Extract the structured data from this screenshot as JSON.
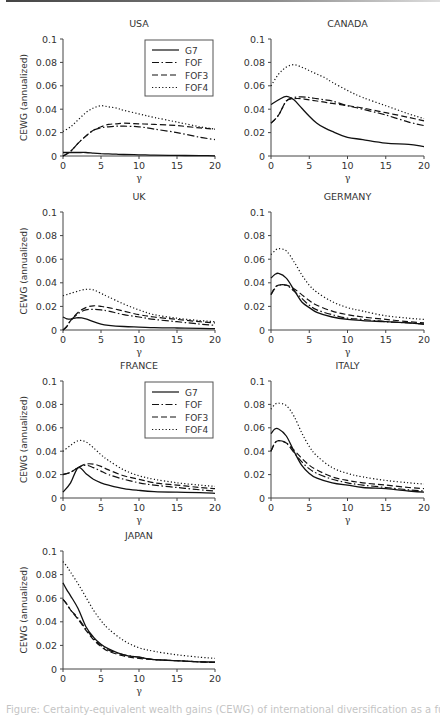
{
  "page": {
    "caption_partial": "Figure: Certainty-equivalent wealth gains (CEWG) of international diversification as a function of risk aversion γ"
  },
  "legend": {
    "entries": [
      {
        "label": "G7",
        "style": "solid"
      },
      {
        "label": "FOF",
        "style": "dashdot"
      },
      {
        "label": "FOF3",
        "style": "dashed"
      },
      {
        "label": "FOF4",
        "style": "dotted"
      }
    ]
  },
  "chart_data": [
    {
      "type": "line",
      "title": "USA",
      "xlabel": "γ",
      "ylabel": "CEWG (annualized)",
      "xlim": [
        0,
        20
      ],
      "ylim": [
        0,
        0.1
      ],
      "xticks": [
        0,
        5,
        10,
        15,
        20
      ],
      "yticks": [
        0,
        0.02,
        0.04,
        0.06,
        0.08,
        0.1
      ],
      "legend_position": "upper right",
      "x": [
        0,
        1,
        2,
        3,
        4,
        5,
        6,
        7,
        8,
        10,
        12,
        15,
        18,
        20
      ],
      "series": [
        {
          "name": "G7",
          "values": [
            0.003,
            0.003,
            0.003,
            0.003,
            0.0025,
            0.002,
            0.0018,
            0.0015,
            0.0013,
            0.001,
            0.0007,
            0.0005,
            0.0003,
            0.0002
          ]
        },
        {
          "name": "FOF",
          "values": [
            0.0,
            0.004,
            0.011,
            0.017,
            0.022,
            0.024,
            0.025,
            0.0255,
            0.0255,
            0.025,
            0.023,
            0.02,
            0.016,
            0.014
          ]
        },
        {
          "name": "FOF3",
          "values": [
            0.0,
            0.004,
            0.011,
            0.017,
            0.022,
            0.025,
            0.027,
            0.0275,
            0.028,
            0.0275,
            0.027,
            0.026,
            0.024,
            0.023
          ]
        },
        {
          "name": "FOF4",
          "values": [
            0.021,
            0.025,
            0.031,
            0.037,
            0.041,
            0.043,
            0.042,
            0.041,
            0.039,
            0.036,
            0.033,
            0.029,
            0.025,
            0.023
          ]
        }
      ]
    },
    {
      "type": "line",
      "title": "CANADA",
      "xlabel": "γ",
      "ylabel": "",
      "xlim": [
        0,
        20
      ],
      "ylim": [
        0,
        0.1
      ],
      "xticks": [
        0,
        5,
        10,
        15,
        20
      ],
      "yticks": [
        0,
        0.02,
        0.04,
        0.06,
        0.08,
        0.1
      ],
      "x": [
        0,
        1,
        2,
        3,
        4,
        5,
        6,
        7,
        8,
        10,
        12,
        15,
        18,
        20
      ],
      "series": [
        {
          "name": "G7",
          "values": [
            0.044,
            0.048,
            0.051,
            0.048,
            0.041,
            0.034,
            0.028,
            0.024,
            0.021,
            0.016,
            0.014,
            0.011,
            0.01,
            0.008
          ]
        },
        {
          "name": "FOF",
          "values": [
            0.028,
            0.035,
            0.047,
            0.05,
            0.0505,
            0.05,
            0.049,
            0.048,
            0.047,
            0.043,
            0.04,
            0.035,
            0.029,
            0.026
          ]
        },
        {
          "name": "FOF3",
          "values": [
            0.028,
            0.035,
            0.047,
            0.049,
            0.049,
            0.048,
            0.047,
            0.046,
            0.045,
            0.043,
            0.041,
            0.037,
            0.033,
            0.03
          ]
        },
        {
          "name": "FOF4",
          "values": [
            0.06,
            0.07,
            0.076,
            0.078,
            0.076,
            0.073,
            0.07,
            0.067,
            0.063,
            0.056,
            0.05,
            0.043,
            0.036,
            0.032
          ]
        }
      ]
    },
    {
      "type": "line",
      "title": "UK",
      "xlabel": "γ",
      "ylabel": "CEWG (annualized)",
      "xlim": [
        0,
        20
      ],
      "ylim": [
        0,
        0.1
      ],
      "xticks": [
        0,
        5,
        10,
        15,
        20
      ],
      "yticks": [
        0,
        0.02,
        0.04,
        0.06,
        0.08,
        0.1
      ],
      "x": [
        0,
        0.5,
        1,
        2,
        3,
        4,
        5,
        6,
        8,
        10,
        12,
        15,
        18,
        20
      ],
      "series": [
        {
          "name": "G7",
          "values": [
            0.011,
            0.0095,
            0.0092,
            0.0105,
            0.0095,
            0.007,
            0.005,
            0.004,
            0.003,
            0.0025,
            0.002,
            0.0017,
            0.0014,
            0.0012
          ]
        },
        {
          "name": "FOF",
          "values": [
            0.0,
            0.003,
            0.008,
            0.014,
            0.017,
            0.0175,
            0.017,
            0.016,
            0.013,
            0.011,
            0.009,
            0.007,
            0.005,
            0.004
          ]
        },
        {
          "name": "FOF3",
          "values": [
            0.0,
            0.003,
            0.008,
            0.015,
            0.019,
            0.0205,
            0.02,
            0.019,
            0.016,
            0.013,
            0.011,
            0.009,
            0.007,
            0.006
          ]
        },
        {
          "name": "FOF4",
          "values": [
            0.029,
            0.03,
            0.031,
            0.033,
            0.0345,
            0.034,
            0.031,
            0.028,
            0.022,
            0.017,
            0.013,
            0.01,
            0.008,
            0.007
          ]
        }
      ]
    },
    {
      "type": "line",
      "title": "GERMANY",
      "xlabel": "γ",
      "ylabel": "",
      "xlim": [
        0,
        20
      ],
      "ylim": [
        0,
        0.1
      ],
      "xticks": [
        0,
        5,
        10,
        15,
        20
      ],
      "yticks": [
        0,
        0.02,
        0.04,
        0.06,
        0.08,
        0.1
      ],
      "x": [
        0,
        0.5,
        1,
        2,
        3,
        4,
        5,
        6,
        8,
        10,
        12,
        15,
        18,
        20
      ],
      "series": [
        {
          "name": "G7",
          "values": [
            0.044,
            0.047,
            0.048,
            0.044,
            0.034,
            0.024,
            0.019,
            0.015,
            0.011,
            0.009,
            0.008,
            0.007,
            0.006,
            0.005
          ]
        },
        {
          "name": "FOF",
          "values": [
            0.03,
            0.035,
            0.038,
            0.038,
            0.033,
            0.027,
            0.021,
            0.017,
            0.013,
            0.01,
            0.009,
            0.007,
            0.006,
            0.005
          ]
        },
        {
          "name": "FOF3",
          "values": [
            0.03,
            0.036,
            0.038,
            0.038,
            0.035,
            0.03,
            0.025,
            0.021,
            0.016,
            0.013,
            0.011,
            0.009,
            0.007,
            0.006
          ]
        },
        {
          "name": "FOF4",
          "values": [
            0.064,
            0.067,
            0.069,
            0.067,
            0.058,
            0.047,
            0.038,
            0.032,
            0.024,
            0.019,
            0.016,
            0.012,
            0.01,
            0.009
          ]
        }
      ]
    },
    {
      "type": "line",
      "title": "FRANCE",
      "xlabel": "γ",
      "ylabel": "CEWG (annualized)",
      "xlim": [
        0,
        20
      ],
      "ylim": [
        0,
        0.1
      ],
      "xticks": [
        0,
        5,
        10,
        15,
        20
      ],
      "yticks": [
        0,
        0.02,
        0.04,
        0.06,
        0.08,
        0.1
      ],
      "legend_position": "upper right",
      "x": [
        0,
        1,
        2,
        3,
        4,
        5,
        6,
        8,
        10,
        12,
        15,
        18,
        20
      ],
      "series": [
        {
          "name": "G7",
          "values": [
            0.005,
            0.013,
            0.026,
            0.021,
            0.016,
            0.013,
            0.011,
            0.008,
            0.0065,
            0.0055,
            0.005,
            0.0045,
            0.004
          ]
        },
        {
          "name": "FOF",
          "values": [
            0.02,
            0.022,
            0.026,
            0.028,
            0.026,
            0.023,
            0.02,
            0.016,
            0.013,
            0.011,
            0.009,
            0.007,
            0.006
          ]
        },
        {
          "name": "FOF3",
          "values": [
            0.02,
            0.022,
            0.026,
            0.029,
            0.029,
            0.027,
            0.024,
            0.019,
            0.016,
            0.013,
            0.011,
            0.009,
            0.008
          ]
        },
        {
          "name": "FOF4",
          "values": [
            0.04,
            0.045,
            0.049,
            0.048,
            0.043,
            0.037,
            0.032,
            0.024,
            0.019,
            0.016,
            0.013,
            0.011,
            0.01
          ]
        }
      ]
    },
    {
      "type": "line",
      "title": "ITALY",
      "xlabel": "γ",
      "ylabel": "",
      "xlim": [
        0,
        20
      ],
      "ylim": [
        0,
        0.1
      ],
      "xticks": [
        0,
        5,
        10,
        15,
        20
      ],
      "yticks": [
        0,
        0.02,
        0.04,
        0.06,
        0.08,
        0.1
      ],
      "x": [
        0,
        0.5,
        1,
        2,
        3,
        4,
        5,
        6,
        8,
        10,
        12,
        15,
        18,
        20
      ],
      "series": [
        {
          "name": "G7",
          "values": [
            0.055,
            0.059,
            0.059,
            0.053,
            0.04,
            0.028,
            0.021,
            0.017,
            0.013,
            0.011,
            0.009,
            0.008,
            0.006,
            0.005
          ]
        },
        {
          "name": "FOF",
          "values": [
            0.04,
            0.047,
            0.049,
            0.047,
            0.039,
            0.031,
            0.025,
            0.021,
            0.016,
            0.013,
            0.011,
            0.009,
            0.007,
            0.006
          ]
        },
        {
          "name": "FOF3",
          "values": [
            0.04,
            0.047,
            0.049,
            0.047,
            0.041,
            0.034,
            0.028,
            0.024,
            0.018,
            0.015,
            0.013,
            0.011,
            0.009,
            0.008
          ]
        },
        {
          "name": "FOF4",
          "values": [
            0.076,
            0.08,
            0.081,
            0.079,
            0.07,
            0.056,
            0.044,
            0.036,
            0.026,
            0.021,
            0.018,
            0.015,
            0.013,
            0.012
          ]
        }
      ]
    },
    {
      "type": "line",
      "title": "JAPAN",
      "xlabel": "γ",
      "ylabel": "CEWG (annualized)",
      "xlim": [
        0,
        20
      ],
      "ylim": [
        0,
        0.1
      ],
      "xticks": [
        0,
        5,
        10,
        15,
        20
      ],
      "yticks": [
        0,
        0.02,
        0.04,
        0.06,
        0.08,
        0.1
      ],
      "x": [
        0,
        0.5,
        1,
        2,
        3,
        4,
        5,
        6,
        8,
        10,
        12,
        15,
        18,
        20
      ],
      "series": [
        {
          "name": "G7",
          "values": [
            0.073,
            0.067,
            0.062,
            0.051,
            0.036,
            0.027,
            0.021,
            0.017,
            0.012,
            0.01,
            0.008,
            0.007,
            0.006,
            0.006
          ]
        },
        {
          "name": "FOF",
          "values": [
            0.059,
            0.055,
            0.05,
            0.043,
            0.034,
            0.026,
            0.02,
            0.016,
            0.012,
            0.01,
            0.008,
            0.007,
            0.006,
            0.0055
          ]
        },
        {
          "name": "FOF3",
          "values": [
            0.059,
            0.055,
            0.05,
            0.042,
            0.033,
            0.025,
            0.019,
            0.015,
            0.011,
            0.009,
            0.008,
            0.007,
            0.006,
            0.0055
          ]
        },
        {
          "name": "FOF4",
          "values": [
            0.091,
            0.087,
            0.082,
            0.072,
            0.061,
            0.05,
            0.041,
            0.034,
            0.024,
            0.018,
            0.015,
            0.012,
            0.01,
            0.009
          ]
        }
      ]
    }
  ]
}
